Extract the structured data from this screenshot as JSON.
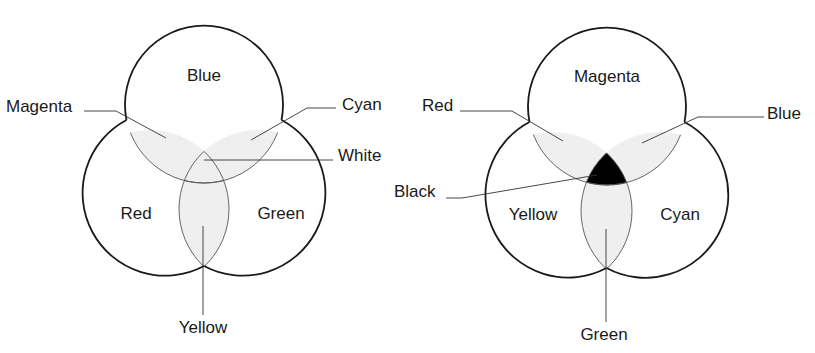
{
  "diagrams": [
    {
      "name": "additive",
      "circles": [
        {
          "label": "Blue",
          "cx": 204,
          "cy": 104,
          "r": 79
        },
        {
          "label": "Red",
          "cx": 150,
          "cy": 209,
          "r": 79
        },
        {
          "label": "Green",
          "cx": 258,
          "cy": 209,
          "r": 79
        }
      ],
      "overlap_labels": {
        "top_left": "Magenta",
        "top_right": "Cyan",
        "center": "White",
        "bottom": "Yellow"
      },
      "center_fill": "#efefef"
    },
    {
      "name": "subtractive",
      "circles": [
        {
          "label": "Magenta",
          "cx": 607,
          "cy": 106,
          "r": 79
        },
        {
          "label": "Yellow",
          "cx": 553,
          "cy": 211,
          "r": 79
        },
        {
          "label": "Cyan",
          "cx": 660,
          "cy": 211,
          "r": 79
        }
      ],
      "overlap_labels": {
        "top_left": "Red",
        "top_right": "Blue",
        "center": "Black",
        "bottom": "Green"
      },
      "center_fill": "#000000"
    }
  ],
  "colors": {
    "stroke": "#1a1a1a",
    "overlap_fill": "#efefef",
    "background": "#ffffff"
  }
}
